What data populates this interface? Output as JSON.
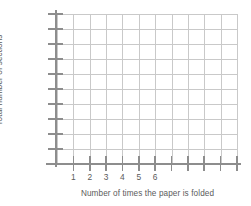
{
  "chart_data": {
    "type": "line",
    "title": "",
    "subtitle": "",
    "xlabel": "Number of times the paper is folded",
    "ylabel": "Total number of sections",
    "series": [],
    "x": [],
    "values": [],
    "annotations": [],
    "legend": {
      "entries": [],
      "position": "none"
    },
    "grid": {
      "visible": true,
      "columns": 11,
      "rows": 10,
      "color": "#c9c9c9"
    },
    "axes": {
      "color": "#8d8d8d",
      "x": {
        "tick_labels": [
          "1",
          "2",
          "3",
          "4",
          "5",
          "6"
        ],
        "total_ticks": 11,
        "unlabeled_ticks": 5,
        "range_labeled": [
          1,
          6
        ]
      },
      "y": {
        "tick_labels": [],
        "total_ticks": 10,
        "labeled": false
      }
    },
    "note": "Blank coordinate grid with no plotted data"
  },
  "styles": {
    "background": "#ffffff",
    "text_color": "#5b5b5b",
    "grid_color": "#c9c9c9",
    "axis_color": "#8d8d8d"
  }
}
